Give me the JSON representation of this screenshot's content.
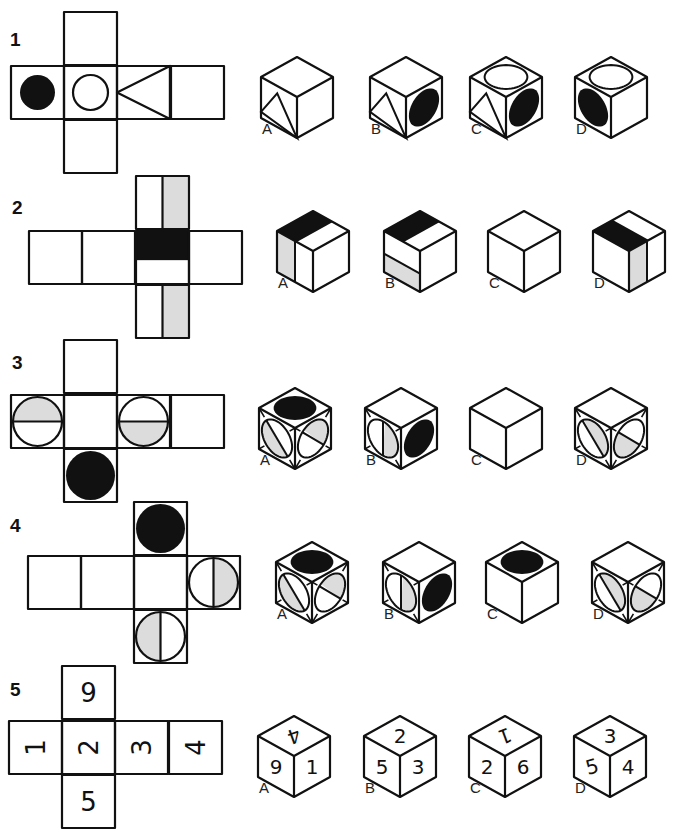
{
  "colors": {
    "ink": "#111111",
    "black_fill": "#111111",
    "shade_fill": "#dcdcdc",
    "background": "#ffffff"
  },
  "puzzles": [
    {
      "number": "1",
      "number_pos": [
        10,
        45
      ],
      "net": {
        "cell": 53,
        "cells": [
          {
            "id": "top",
            "x": 64,
            "y": 12,
            "content": "blank"
          },
          {
            "id": "left",
            "x": 11,
            "y": 66,
            "content": "black-circle"
          },
          {
            "id": "center",
            "x": 64,
            "y": 66,
            "content": "white-circle"
          },
          {
            "id": "right",
            "x": 117,
            "y": 66,
            "content": "triangle-left"
          },
          {
            "id": "far",
            "x": 171,
            "y": 66,
            "content": "blank"
          },
          {
            "id": "bottom",
            "x": 64,
            "y": 120,
            "content": "blank"
          }
        ]
      },
      "options": [
        {
          "label": "A",
          "cx": 297,
          "top": 57,
          "faces": {
            "top": "blank",
            "left": "triangle-up",
            "right": "blank"
          }
        },
        {
          "label": "B",
          "cx": 406,
          "top": 57,
          "faces": {
            "top": "blank",
            "left": "triangle-up",
            "right": "black-ellipse"
          }
        },
        {
          "label": "C",
          "cx": 506,
          "top": 57,
          "faces": {
            "top": "white-ellipse",
            "left": "triangle-up",
            "right": "black-ellipse"
          }
        },
        {
          "label": "D",
          "cx": 611,
          "top": 57,
          "faces": {
            "top": "white-ellipse",
            "left": "black-ellipse",
            "right": "blank"
          }
        }
      ]
    },
    {
      "number": "2",
      "number_pos": [
        12,
        213
      ],
      "net": {
        "cell": 53,
        "cells": [
          {
            "id": "top",
            "x": 136,
            "y": 176,
            "content": "vstripe-right-shaded"
          },
          {
            "id": "l2",
            "x": 29,
            "y": 231,
            "content": "blank"
          },
          {
            "id": "l1",
            "x": 82,
            "y": 231,
            "content": "blank"
          },
          {
            "id": "center",
            "x": 136,
            "y": 231,
            "content": "black-top-band"
          },
          {
            "id": "right",
            "x": 189,
            "y": 231,
            "content": "blank"
          },
          {
            "id": "bottom",
            "x": 136,
            "y": 285,
            "content": "vstripe-right-shaded"
          }
        ]
      },
      "options": [
        {
          "label": "A",
          "cx": 313,
          "top": 211,
          "faces": {
            "top": "black-band-diag",
            "left": "vstripe-left-shaded",
            "right": "blank"
          }
        },
        {
          "label": "B",
          "cx": 420,
          "top": 211,
          "faces": {
            "top": "black-band-diag",
            "left": "hband-bottom-shaded",
            "right": "blank"
          }
        },
        {
          "label": "C",
          "cx": 524,
          "top": 211,
          "faces": {
            "top": "blank",
            "left": "blank",
            "right": "blank"
          }
        },
        {
          "label": "D",
          "cx": 629,
          "top": 211,
          "faces": {
            "top": "black-band-diag2",
            "left": "blank",
            "right": "vstripe-mid-shaded"
          }
        }
      ]
    },
    {
      "number": "3",
      "number_pos": [
        12,
        368
      ],
      "net": {
        "cell": 53,
        "cells": [
          {
            "id": "top",
            "x": 64,
            "y": 340,
            "content": "blank"
          },
          {
            "id": "left",
            "x": 11,
            "y": 395,
            "content": "circle-hsplit-top-shaded"
          },
          {
            "id": "center",
            "x": 64,
            "y": 395,
            "content": "blank"
          },
          {
            "id": "right",
            "x": 117,
            "y": 395,
            "content": "circle-hsplit-bottom-shaded"
          },
          {
            "id": "far",
            "x": 171,
            "y": 395,
            "content": "blank"
          },
          {
            "id": "bottom",
            "x": 64,
            "y": 449,
            "content": "black-circle-full"
          }
        ]
      },
      "options": [
        {
          "label": "A",
          "cx": 295,
          "top": 388,
          "faces": {
            "top": "black-ellipse",
            "left": "circle-split-shaded-a",
            "right": "circle-split-shaded-b"
          }
        },
        {
          "label": "B",
          "cx": 401,
          "top": 388,
          "faces": {
            "top": "blank",
            "left": "circle-vsplit-shaded",
            "right": "black-ellipse"
          }
        },
        {
          "label": "C",
          "cx": 506,
          "top": 388,
          "faces": {
            "top": "blank",
            "left": "blank",
            "right": "blank"
          }
        },
        {
          "label": "D",
          "cx": 611,
          "top": 388,
          "faces": {
            "top": "blank",
            "left": "circle-split-shaded-c",
            "right": "circle-split-shaded-d"
          }
        }
      ]
    },
    {
      "number": "4",
      "number_pos": [
        10,
        531
      ],
      "net": {
        "cell": 53,
        "cells": [
          {
            "id": "top",
            "x": 134,
            "y": 502,
            "content": "black-circle-full"
          },
          {
            "id": "l2",
            "x": 28,
            "y": 556,
            "content": "blank"
          },
          {
            "id": "l1",
            "x": 81,
            "y": 556,
            "content": "blank"
          },
          {
            "id": "center",
            "x": 134,
            "y": 556,
            "content": "blank"
          },
          {
            "id": "right",
            "x": 187,
            "y": 556,
            "content": "circle-vsplit-right-shaded"
          },
          {
            "id": "bottom",
            "x": 134,
            "y": 610,
            "content": "circle-vsplit-left-shaded"
          }
        ]
      },
      "options": [
        {
          "label": "A",
          "cx": 312,
          "top": 542,
          "faces": {
            "top": "black-ellipse",
            "left": "circle-split-shaded-a",
            "right": "circle-split-shaded-b"
          }
        },
        {
          "label": "B",
          "cx": 419,
          "top": 542,
          "faces": {
            "top": "blank",
            "left": "circle-vsplit-shaded",
            "right": "black-ellipse"
          }
        },
        {
          "label": "C",
          "cx": 522,
          "top": 542,
          "faces": {
            "top": "black-ellipse",
            "left": "blank",
            "right": "blank"
          }
        },
        {
          "label": "D",
          "cx": 628,
          "top": 542,
          "faces": {
            "top": "blank",
            "left": "circle-split-shaded-c",
            "right": "circle-split-shaded-d"
          }
        }
      ]
    },
    {
      "number": "5",
      "number_pos": [
        10,
        695
      ],
      "net": {
        "cell": 53,
        "cells": [
          {
            "id": "top",
            "x": 62,
            "y": 666,
            "content": "text",
            "text": "9",
            "rotate": 0
          },
          {
            "id": "left",
            "x": 9,
            "y": 721,
            "content": "text",
            "text": "1",
            "rotate": -90
          },
          {
            "id": "center",
            "x": 62,
            "y": 721,
            "content": "text",
            "text": "2",
            "rotate": -90
          },
          {
            "id": "right",
            "x": 115,
            "y": 721,
            "content": "text",
            "text": "3",
            "rotate": -90
          },
          {
            "id": "far",
            "x": 169,
            "y": 721,
            "content": "text",
            "text": "4",
            "rotate": -90
          },
          {
            "id": "bottom",
            "x": 62,
            "y": 775,
            "content": "text",
            "text": "5",
            "rotate": 0
          }
        ]
      },
      "options": [
        {
          "label": "A",
          "cx": 294,
          "top": 716,
          "faces": {
            "top": "text:4:rot",
            "left": "text:9",
            "right": "text:1"
          }
        },
        {
          "label": "B",
          "cx": 400,
          "top": 716,
          "faces": {
            "top": "text:2",
            "left": "text:5",
            "right": "text:3"
          }
        },
        {
          "label": "C",
          "cx": 505,
          "top": 716,
          "faces": {
            "top": "text:1:rot",
            "left": "text:2",
            "right": "text:6"
          }
        },
        {
          "label": "D",
          "cx": 610,
          "top": 716,
          "faces": {
            "top": "text:3",
            "left": "text:5:rot",
            "right": "text:4"
          }
        }
      ]
    }
  ]
}
